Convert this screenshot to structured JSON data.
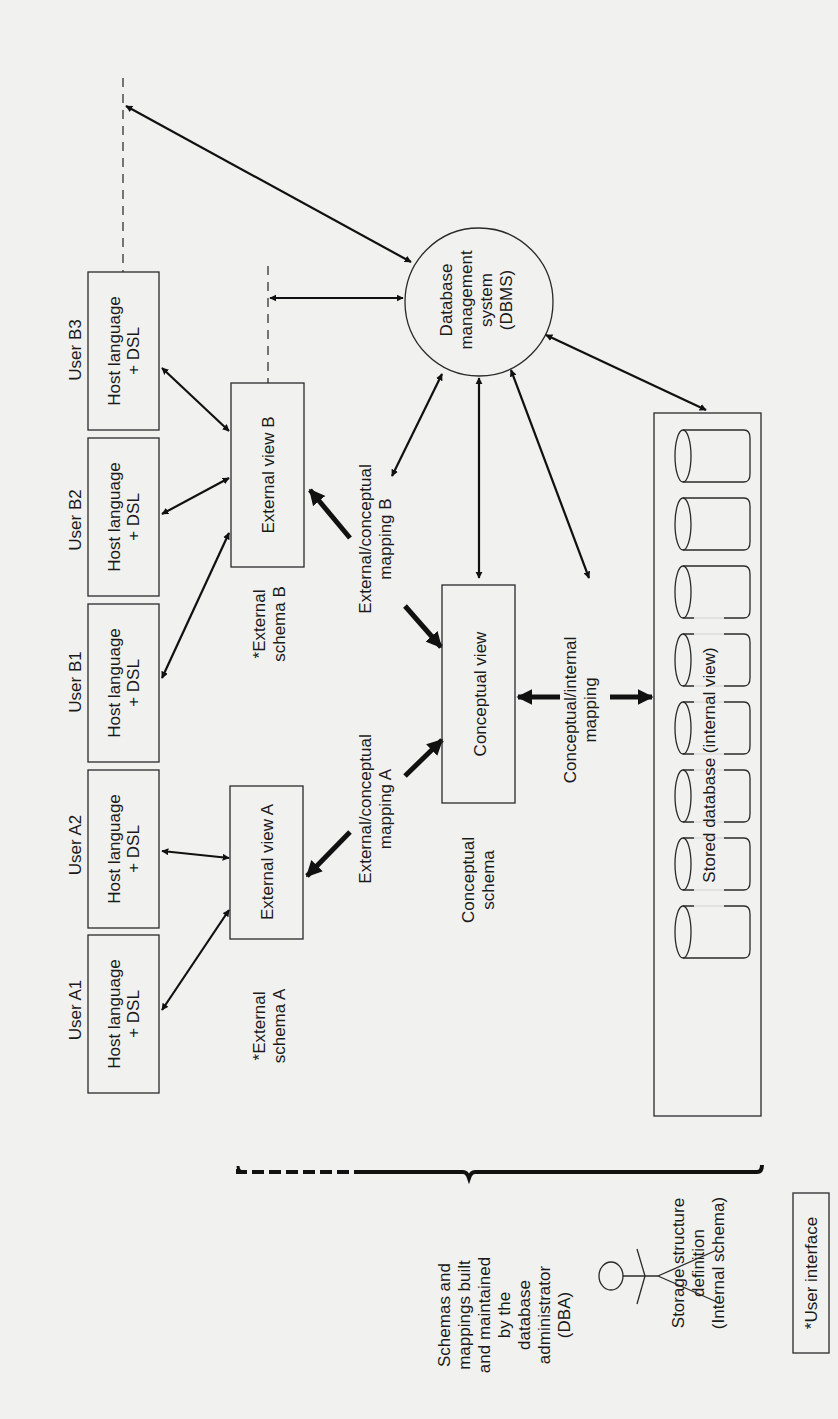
{
  "diagram": {
    "orientation": "rotated 90 degrees counter-clockwise",
    "users": [
      {
        "label": "User A1",
        "box": "Host language",
        "box2": "+ DSL"
      },
      {
        "label": "User A2",
        "box": "Host language",
        "box2": "+ DSL"
      },
      {
        "label": "User B1",
        "box": "Host language",
        "box2": "+ DSL"
      },
      {
        "label": "User B2",
        "box": "Host language",
        "box2": "+ DSL"
      },
      {
        "label": "User B3",
        "box": "Host language",
        "box2": "+ DSL"
      }
    ],
    "external_views": [
      {
        "label": "External view A",
        "schema_line1": "*External",
        "schema_line2": "schema A"
      },
      {
        "label": "External view B",
        "schema_line1": "*External",
        "schema_line2": "schema B"
      }
    ],
    "mappings": {
      "ext_conc_a_line1": "External/conceptual",
      "ext_conc_a_line2": "mapping A",
      "ext_conc_b_line1": "External/conceptual",
      "ext_conc_b_line2": "mapping B",
      "conc_int_line1": "Conceptual/internal",
      "conc_int_line2": "mapping"
    },
    "conceptual": {
      "view_label": "Conceptual view",
      "schema_line1": "Conceptual",
      "schema_line2": "schema"
    },
    "dbms": {
      "line1": "Database",
      "line2": "management",
      "line3": "system",
      "line4": "(DBMS)"
    },
    "stored_db": {
      "label": "Stored database (internal view)",
      "cylinder_count": 8,
      "def_line1": "Storage structure",
      "def_line2": "definition",
      "def_line3": "(Internal schema)"
    },
    "dba": {
      "line1": "Schemas and",
      "line2": "mappings built",
      "line3": "and maintained",
      "line4": "by the",
      "line5": "database",
      "line6": "administrator",
      "line7": "(DBA)"
    },
    "legend": {
      "label": "*User interface"
    }
  }
}
